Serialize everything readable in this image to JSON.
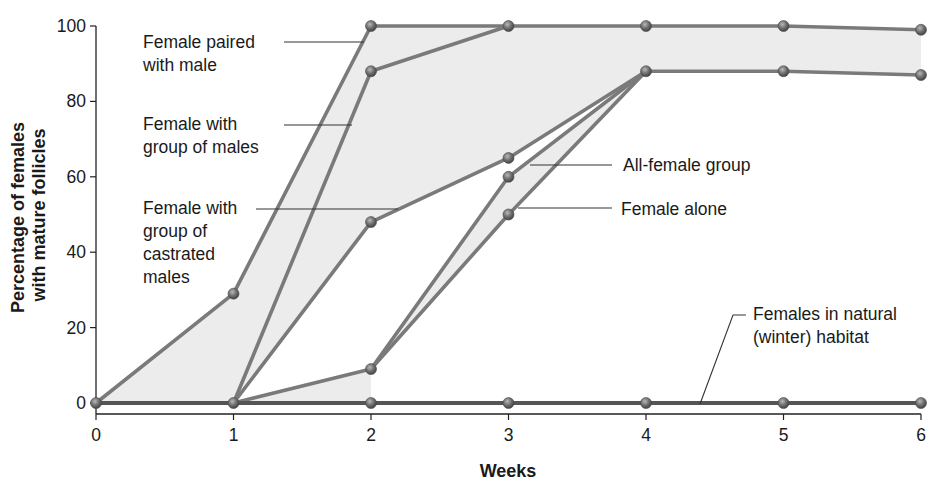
{
  "chart_data": {
    "type": "line",
    "title": "",
    "xlabel": "Weeks",
    "ylabel": "Percentage of females with mature follicles",
    "ylabel_lines": [
      "Percentage of females",
      "with mature follicles"
    ],
    "x": [
      0,
      1,
      2,
      3,
      4,
      5,
      6
    ],
    "x_ticks": [
      "0",
      "1",
      "2",
      "3",
      "4",
      "5",
      "6"
    ],
    "y_ticks": [
      "0",
      "20",
      "40",
      "60",
      "80",
      "100"
    ],
    "xlim": [
      0,
      6
    ],
    "ylim": [
      0,
      100
    ],
    "grid": false,
    "legend": "inline annotations with leader lines",
    "shaded_regions": [
      {
        "between": [
          "Female paired with male",
          "Female with group of castrated males"
        ],
        "color": "#ececec"
      },
      {
        "between": [
          "All-female group",
          "Female alone"
        ],
        "color": "#ececec"
      }
    ],
    "series": [
      {
        "name": "Female paired with male",
        "label_lines": [
          "Female paired",
          "with male"
        ],
        "x": [
          0,
          1,
          2,
          3,
          4,
          5,
          6
        ],
        "values": [
          0,
          29,
          100,
          100,
          100,
          100,
          99
        ]
      },
      {
        "name": "Female with group of males",
        "label_lines": [
          "Female with",
          "group of males"
        ],
        "x": [
          1,
          2,
          3
        ],
        "values": [
          0,
          88,
          100
        ]
      },
      {
        "name": "Female with group of castrated males",
        "label_lines": [
          "Female with",
          "group of",
          "castrated",
          "males"
        ],
        "x": [
          1,
          2,
          3,
          4,
          5,
          6
        ],
        "values": [
          0,
          48,
          65,
          88,
          88,
          87
        ]
      },
      {
        "name": "All-female group",
        "label_lines": [
          "All-female group"
        ],
        "x": [
          1,
          2,
          3,
          4
        ],
        "values": [
          0,
          9,
          60,
          88
        ]
      },
      {
        "name": "Female alone",
        "label_lines": [
          "Female alone"
        ],
        "x": [
          2,
          3,
          4
        ],
        "values": [
          9,
          50,
          88
        ]
      },
      {
        "name": "Females in natural (winter) habitat",
        "label_lines": [
          "Females in natural",
          "(winter) habitat"
        ],
        "x": [
          0,
          1,
          2,
          3,
          4,
          5,
          6
        ],
        "values": [
          0,
          0,
          0,
          0,
          0,
          0,
          0
        ]
      }
    ],
    "colors": {
      "line": "#7a7a7a",
      "marker": "#6e6e6e",
      "natural_line": "#555555",
      "shade": "#ececec",
      "axis": "#222222",
      "text": "#1a1a1a"
    }
  }
}
